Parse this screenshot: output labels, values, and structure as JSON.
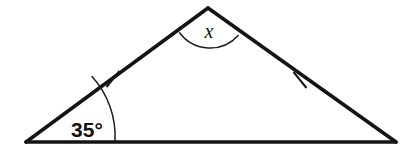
{
  "figure": {
    "kind": "geometry-diagram",
    "shape": "triangle",
    "background_color": "#ffffff",
    "stroke_color": "#141414",
    "arc_color": "#1d1d1d",
    "label_color": "#111111"
  },
  "labels": {
    "base_angle": "35°",
    "apex_angle": "x"
  },
  "chart_data": {
    "type": "diagram",
    "title": "",
    "shape": "isosceles triangle",
    "vertices": [
      {
        "name": "left-vertex",
        "x": 26,
        "y": 142
      },
      {
        "name": "apex-vertex",
        "x": 208,
        "y": 8
      },
      {
        "name": "right-vertex",
        "x": 396,
        "y": 142
      }
    ],
    "sides": [
      {
        "name": "base",
        "from": "left-vertex",
        "to": "right-vertex",
        "tick_marks": 0
      },
      {
        "name": "left-leg",
        "from": "left-vertex",
        "to": "apex-vertex",
        "tick_marks": 1
      },
      {
        "name": "right-leg",
        "from": "apex-vertex",
        "to": "right-vertex",
        "tick_marks": 1
      }
    ],
    "angles": [
      {
        "at": "left-vertex",
        "label": "35°",
        "value": 35,
        "unit": "degrees",
        "marked": true
      },
      {
        "at": "apex-vertex",
        "label": "x",
        "value": null,
        "unit": "degrees",
        "marked": true
      },
      {
        "at": "right-vertex",
        "label": "",
        "value": null,
        "unit": "degrees",
        "marked": false
      }
    ],
    "congruence_marks": [
      {
        "side": "left-leg",
        "marks": 1,
        "position": {
          "x": 113,
          "y": 79
        }
      },
      {
        "side": "right-leg",
        "marks": 1,
        "position": {
          "x": 300,
          "y": 80
        }
      }
    ]
  },
  "geometry": {
    "left_vertex": {
      "x": 26,
      "y": 142
    },
    "apex_vertex": {
      "x": 208,
      "y": 8
    },
    "right_vertex": {
      "x": 396,
      "y": 142
    },
    "base_arc": {
      "radius": 89,
      "start": {
        "x": 115,
        "y": 141.2
      },
      "end": {
        "x": 92.0,
        "y": 76.6
      }
    },
    "apex_arc": {
      "radius": 38,
      "start": {
        "x": 179.6,
        "y": 32.8
      },
      "end": {
        "x": 238.2,
        "y": 35.5
      },
      "sweep_bottom": {
        "x": 209,
        "y": 46
      }
    },
    "left_tick": {
      "x1": 106.5,
      "y1": 87.0,
      "x2": 119.5,
      "y2": 71.0
    },
    "right_tick": {
      "x1": 293.5,
      "y1": 72.0,
      "x2": 306.5,
      "y2": 88.0
    },
    "base_angle_label_pos": {
      "x": 87,
      "y": 137
    },
    "apex_angle_label_pos": {
      "x": 209,
      "y": 38
    }
  }
}
